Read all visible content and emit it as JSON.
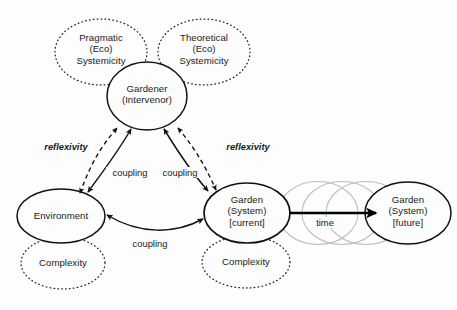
{
  "diagram": {
    "background_color": "#fdfdfd",
    "stroke_color": "#1a1a1a",
    "faint_stroke_color": "#b9b9b9",
    "nodes": {
      "pragmatic": {
        "line1": "Pragmatic",
        "line2": "(Eco)",
        "line3": "Systemicity",
        "style": "dotted"
      },
      "theoretical": {
        "line1": "Theoretical",
        "line2": "(Eco)",
        "line3": "Systemicity",
        "style": "dotted"
      },
      "gardener": {
        "line1": "Gardener",
        "line2": "(Intervenor)",
        "style": "solid"
      },
      "environment": {
        "line1": "Environment",
        "style": "solid"
      },
      "environment_complexity": {
        "line1": "Complexity",
        "style": "dotted"
      },
      "garden_current": {
        "line1": "Garden",
        "line2": "(System)",
        "line3": "[current]",
        "style": "solid"
      },
      "garden_complexity": {
        "line1": "Complexity",
        "style": "dotted"
      },
      "garden_future": {
        "line1": "Garden",
        "line2": "(System)",
        "line3": "[future]",
        "style": "solid"
      },
      "ghost_1": {
        "style": "faint"
      },
      "ghost_2": {
        "style": "faint"
      },
      "ghost_3": {
        "style": "faint"
      }
    },
    "edges": {
      "reflexivity_left": {
        "label": "reflexivity",
        "style": "dashed",
        "arrows": "both"
      },
      "reflexivity_right": {
        "label": "reflexivity",
        "style": "dashed",
        "arrows": "both"
      },
      "coupling_left": {
        "label": "coupling",
        "style": "solid",
        "arrows": "both"
      },
      "coupling_right": {
        "label": "coupling",
        "style": "solid",
        "arrows": "both"
      },
      "coupling_bottom": {
        "label": "coupling",
        "style": "solid",
        "arrows": "both"
      },
      "time": {
        "label": "time",
        "style": "thick-solid",
        "arrows": "forward"
      }
    }
  }
}
